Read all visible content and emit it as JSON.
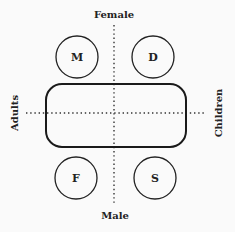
{
  "diagram": {
    "axes": {
      "top": "Female",
      "bottom": "Male",
      "left": "Adults",
      "right": "Children"
    },
    "nodes": [
      {
        "id": "M",
        "label": "M",
        "quadrant": "top-left"
      },
      {
        "id": "D",
        "label": "D",
        "quadrant": "top-right"
      },
      {
        "id": "F",
        "label": "F",
        "quadrant": "bottom-left"
      },
      {
        "id": "S",
        "label": "S",
        "quadrant": "bottom-right"
      }
    ],
    "center_shape": "rounded-rectangle",
    "colors": {
      "stroke": "#222222",
      "background": "#fafafa"
    }
  }
}
